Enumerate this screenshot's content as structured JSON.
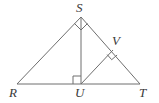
{
  "figure": {
    "type": "geometry-diagram",
    "background_color": "#ffffff",
    "stroke_color": "#6e6e6e",
    "label_color": "#3a3a3a",
    "stroke_width": 1,
    "width": 159,
    "height": 103,
    "points": [
      {
        "name": "R",
        "label": "R",
        "x": 17,
        "y": 84,
        "label_x": 9,
        "label_y": 87
      },
      {
        "name": "S",
        "label": "S",
        "x": 81,
        "y": 17,
        "label_x": 76,
        "label_y": 1
      },
      {
        "name": "T",
        "label": "T",
        "x": 140,
        "y": 84,
        "label_x": 140,
        "label_y": 87
      },
      {
        "name": "U",
        "label": "U",
        "x": 81,
        "y": 84,
        "label_x": 75,
        "label_y": 87
      },
      {
        "name": "V",
        "label": "V",
        "x": 113,
        "y": 50,
        "label_x": 113,
        "label_y": 34
      }
    ],
    "segments": [
      {
        "name": "RT",
        "from": "R",
        "to": "T"
      },
      {
        "name": "RS",
        "from": "R",
        "to": "S"
      },
      {
        "name": "ST",
        "from": "S",
        "to": "T"
      },
      {
        "name": "SU",
        "from": "S",
        "to": "U"
      },
      {
        "name": "UV",
        "from": "U",
        "to": "V"
      }
    ],
    "right_angles": [
      {
        "name": "right-angle-at-S",
        "at": "S",
        "size": 9
      },
      {
        "name": "right-angle-at-U",
        "at": "U",
        "size": 8
      },
      {
        "name": "right-angle-at-V",
        "at": "V",
        "size": 8
      }
    ]
  }
}
